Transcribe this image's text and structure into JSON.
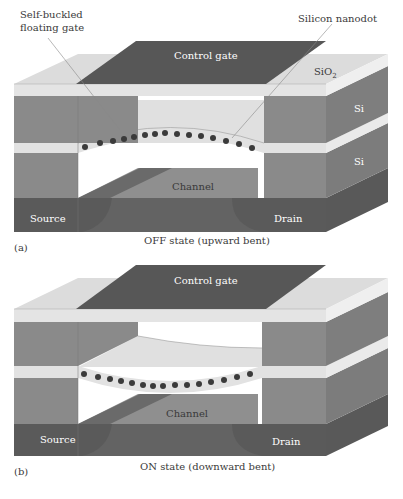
{
  "colors": {
    "sio2": "#d9d9d9",
    "sio2_light": "#e6e6e6",
    "si": "#8a8a8a",
    "si_side": "#7d7d7d",
    "dark": "#5f5f5f",
    "gate": "#555555",
    "channel": "#8f8f8f",
    "dot": "#3b3b3b",
    "gap": "#ffffff"
  },
  "panel_a": {
    "tag": "(a)",
    "caption": "OFF state (upward bent)",
    "labels": {
      "floating_gate_line1": "Self-buckled",
      "floating_gate_line2": "floating gate",
      "nanodot": "Silicon nanodot",
      "control_gate": "Control gate",
      "sio2_prefix": "SiO",
      "sio2_sub": "2",
      "si_upper": "Si",
      "si_lower": "Si",
      "channel": "Channel",
      "source": "Source",
      "drain": "Drain"
    },
    "nanodot_count": 15,
    "bend": "upward"
  },
  "panel_b": {
    "tag": "(b)",
    "caption": "ON state (downward bent)",
    "labels": {
      "control_gate": "Control gate",
      "channel": "Channel",
      "source": "Source",
      "drain": "Drain"
    },
    "nanodot_count": 15,
    "bend": "downward"
  }
}
